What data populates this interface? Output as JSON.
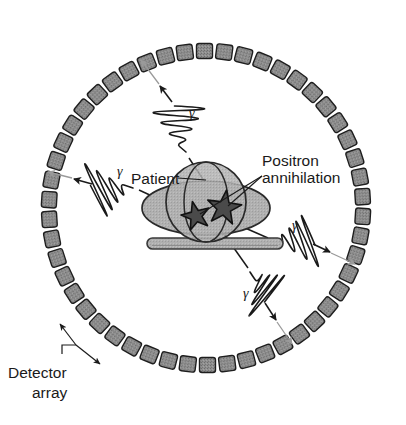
{
  "figure": {
    "labels": {
      "detector_array_line1": "Detector",
      "detector_array_line2": "array",
      "patient": "Patient",
      "positron_line1": "Positron",
      "positron_line2": "annihilation",
      "gamma_symbol": "γ"
    },
    "colors": {
      "detector_fill": "#8f8f8f",
      "detector_stroke": "#1e1e1e",
      "patient_fill": "#b0b0b0",
      "patient_stroke": "#2a2a2a",
      "bed_fill": "#b5b5b5",
      "bed_stroke": "#3a3a3a",
      "star_fill": "#4a4a4a",
      "star_stroke": "#111111",
      "gamma_stroke": "#1a1a1a",
      "arrow_gray": "#9a9a9a",
      "text": "#1a1a1a",
      "background": "#ffffff"
    },
    "ring": {
      "center_x": 206,
      "center_y": 208,
      "radius": 157,
      "detector_count": 50,
      "detector_width": 19,
      "detector_height": 15
    },
    "patient": {
      "body_cx": 206,
      "body_cy": 208,
      "body_rx": 64,
      "body_ry": 27,
      "head_cx": 206,
      "head_cy": 202,
      "head_r": 40,
      "bed_x": 147,
      "bed_y": 238,
      "bed_w": 136,
      "bed_h": 11
    },
    "stars": [
      {
        "name": "annihilation-star-left",
        "cx": 196,
        "cy": 216,
        "r": 15,
        "label": "γ"
      },
      {
        "name": "annihilation-star-right",
        "cx": 224,
        "cy": 208,
        "r": 18,
        "label": "γ"
      }
    ],
    "gamma_rays": [
      {
        "name": "gamma-ray-upper-left",
        "symbol": "γ",
        "direction": "up-left"
      },
      {
        "name": "gamma-ray-left",
        "symbol": "γ",
        "direction": "left"
      },
      {
        "name": "gamma-ray-right",
        "symbol": "γ",
        "direction": "right-down"
      },
      {
        "name": "gamma-ray-lower-right",
        "symbol": "γ",
        "direction": "down-right"
      }
    ]
  }
}
